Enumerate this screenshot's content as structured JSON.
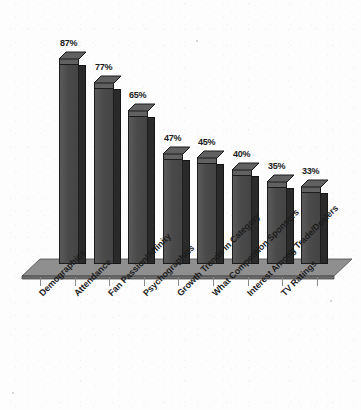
{
  "chart_data": {
    "type": "bar",
    "title": "",
    "subtitle": "",
    "xlabel": "",
    "ylabel": "",
    "ylim": [
      0,
      100
    ],
    "grid": false,
    "legend": false,
    "legend_position": "none",
    "style": "3d-column",
    "value_suffix": "%",
    "categories": [
      "Demographics",
      "Attendance",
      "Fan Passion/Affinity",
      "Psychographics",
      "Growth Trends in Category",
      "What Competition Sponsors",
      "Interest Among Trade/Dealers",
      "TV Ratings"
    ],
    "values": [
      87,
      77,
      65,
      47,
      45,
      40,
      35,
      33
    ],
    "value_labels": [
      "87%",
      "77%",
      "65%",
      "47%",
      "45%",
      "40%",
      "35%",
      "33%"
    ],
    "annotations": []
  },
  "colors": {
    "bar_front": "#4a4a4a",
    "bar_side": "#2a2a2a",
    "bar_top": "#616161",
    "bar_outline": "#1c1c1c",
    "floor_top": "#8f8f8f",
    "floor_front": "#6e6e6e",
    "background": "#fdfdfd",
    "text": "#1c1c1c",
    "tick": "#8a8a8a"
  }
}
